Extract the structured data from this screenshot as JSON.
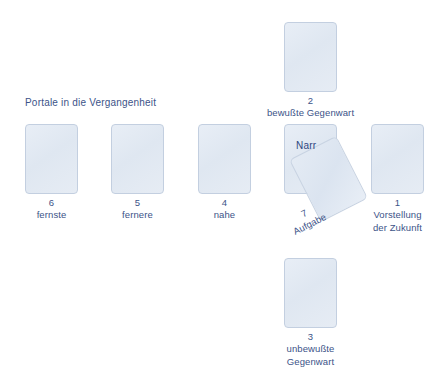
{
  "diagram": {
    "title_left": "Portale in die Vergangenheit",
    "accent_color": "#3c5388",
    "card_fill": "#e3eaf3",
    "card_border": "#c3cfe0",
    "background": "#ffffff"
  },
  "cards": {
    "six": {
      "number": "6",
      "label": "fernste"
    },
    "five": {
      "number": "5",
      "label": "fernere"
    },
    "four": {
      "number": "4",
      "label": "nahe"
    },
    "two": {
      "number": "2",
      "label": "bewußte Gegenwart"
    },
    "three": {
      "number": "3",
      "label": "unbewußte\nGegenwart"
    },
    "one": {
      "number": "1",
      "label": "Vorstellung\nder Zukunft"
    },
    "center": {
      "name": "Narr"
    },
    "seven": {
      "number": "7",
      "label": "Aufgabe"
    }
  }
}
